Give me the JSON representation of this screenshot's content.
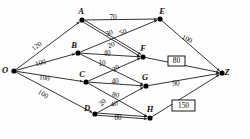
{
  "diagram": {
    "type": "directed-graph",
    "nodes": [
      {
        "id": "O",
        "label": "O",
        "x": 14,
        "y": 71,
        "label_dx": -9,
        "label_dy": 2
      },
      {
        "id": "A",
        "label": "A",
        "x": 82,
        "y": 20,
        "label_dx": -1,
        "label_dy": -6
      },
      {
        "id": "B",
        "label": "B",
        "x": 78,
        "y": 53,
        "label_dx": -4,
        "label_dy": -5
      },
      {
        "id": "C",
        "label": "C",
        "x": 86,
        "y": 82,
        "label_dx": -4,
        "label_dy": -5
      },
      {
        "id": "D",
        "label": "D",
        "x": 95,
        "y": 114,
        "label_dx": -8,
        "label_dy": -3
      },
      {
        "id": "E",
        "label": "E",
        "x": 160,
        "y": 19,
        "label_dx": 2,
        "label_dy": -5
      },
      {
        "id": "F",
        "label": "F",
        "x": 143,
        "y": 57,
        "label_dx": 0,
        "label_dy": -6
      },
      {
        "id": "G",
        "label": "G",
        "x": 146,
        "y": 86,
        "label_dx": -1,
        "label_dy": -6
      },
      {
        "id": "H",
        "label": "H",
        "x": 150,
        "y": 118,
        "label_dx": 0,
        "label_dy": -6
      },
      {
        "id": "Z",
        "label": "Z",
        "x": 222,
        "y": 73,
        "label_dx": 5,
        "label_dy": 2
      }
    ],
    "edges": [
      {
        "from": "O",
        "to": "A",
        "weight": "120",
        "lx": 38,
        "ly": 48,
        "rot": -37
      },
      {
        "from": "O",
        "to": "B",
        "weight": "100",
        "lx": 41,
        "ly": 65,
        "rot": -14
      },
      {
        "from": "O",
        "to": "C",
        "weight": "100",
        "lx": 44,
        "ly": 80,
        "rot": 9
      },
      {
        "from": "O",
        "to": "D",
        "weight": "100",
        "lx": 42,
        "ly": 96,
        "rot": 30
      },
      {
        "from": "A",
        "to": "E",
        "weight": "70",
        "lx": 113,
        "ly": 20,
        "rot": 0
      },
      {
        "from": "A",
        "to": "F",
        "weight": "30",
        "lx": 110,
        "ly": 35,
        "rot": -22
      },
      {
        "from": "A",
        "to": "F",
        "weight": "20",
        "lx": 112,
        "ly": 47,
        "rot": -22
      },
      {
        "from": "B",
        "to": "E",
        "weight": "50",
        "lx": 124,
        "ly": 34,
        "rot": -27
      },
      {
        "from": "B",
        "to": "F",
        "weight": "40",
        "lx": 107,
        "ly": 56,
        "rot": 0
      },
      {
        "from": "B",
        "to": "G",
        "weight": "10",
        "lx": 102,
        "ly": 66,
        "rot": 0
      },
      {
        "from": "C",
        "to": "F",
        "weight": "20",
        "lx": 117,
        "ly": 70,
        "rot": -32
      },
      {
        "from": "C",
        "to": "G",
        "weight": "40",
        "lx": 115,
        "ly": 84,
        "rot": 0
      },
      {
        "from": "C",
        "to": "H",
        "weight": "80",
        "lx": 115,
        "ly": 97,
        "rot": 17
      },
      {
        "from": "D",
        "to": "G",
        "weight": "20",
        "lx": 104,
        "ly": 104,
        "rot": -46
      },
      {
        "from": "D",
        "to": "H",
        "weight": "40",
        "lx": 115,
        "ly": 106,
        "rot": -20
      },
      {
        "from": "D",
        "to": "H",
        "weight": "80",
        "lx": 118,
        "ly": 120,
        "rot": 0
      },
      {
        "from": "E",
        "to": "Z",
        "weight": "100",
        "lx": 186,
        "ly": 41,
        "rot": 27
      },
      {
        "from": "F",
        "to": "Z",
        "weight": "80",
        "lx": 176,
        "ly": 62,
        "rot": 0,
        "boxed": true
      },
      {
        "from": "G",
        "to": "Z",
        "weight": "90",
        "lx": 176,
        "ly": 86,
        "rot": 0
      },
      {
        "from": "H",
        "to": "Z",
        "weight": "150",
        "lx": 183,
        "ly": 106,
        "rot": 0,
        "boxed": true
      }
    ],
    "boxed_values": [
      {
        "value": "80",
        "x": 168,
        "y": 56,
        "w": 17,
        "h": 10
      },
      {
        "value": "150",
        "x": 172,
        "y": 100,
        "w": 23,
        "h": 11
      }
    ]
  }
}
